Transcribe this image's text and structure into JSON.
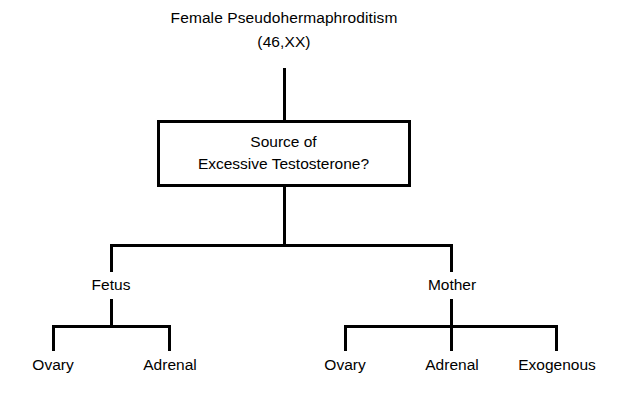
{
  "diagram": {
    "type": "flowchart",
    "orientation": "top-down",
    "background_color": "#ffffff",
    "line_color": "#000000",
    "root": {
      "title_line1": "Female Pseudohermaphroditism",
      "title_line2": "(46,XX)"
    },
    "decision": {
      "line1": "Source of",
      "line2": "Excessive Testosterone?"
    },
    "branches": [
      {
        "label": "Fetus",
        "x": 111,
        "children": [
          {
            "label": "Ovary",
            "x": 53
          },
          {
            "label": "Adrenal",
            "x": 170
          }
        ]
      },
      {
        "label": "Mother",
        "x": 452,
        "children": [
          {
            "label": "Ovary",
            "x": 345
          },
          {
            "label": "Adrenal",
            "x": 452
          },
          {
            "label": "Exogenous",
            "x": 557
          }
        ]
      }
    ]
  }
}
